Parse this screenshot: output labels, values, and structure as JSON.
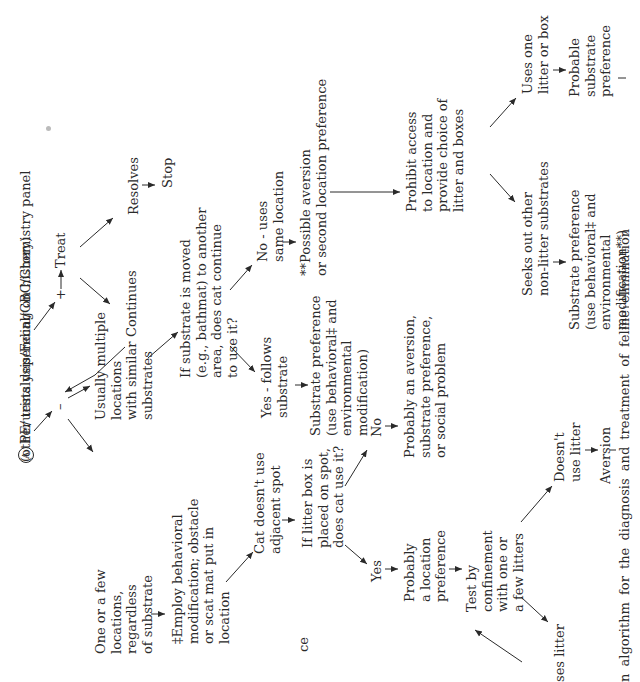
{
  "figure": {
    "start_marker": "A",
    "start_text": "PE/urinalysis/Fecal/CBC/Chemistry panel",
    "start_subtext": "(other tests depending on history)",
    "plus": "+",
    "minus": "–",
    "treat": "Treat",
    "resolves": "Resolves",
    "stop": "Stop",
    "continues": "Continues",
    "few_locations": "One or a few\nlocations,\nregardless\nof substrate",
    "multiple_locations": "Usually multiple\nlocations\nwith similar\nsubstrates",
    "employ_behavioral": "‡Employ behavioral\nmodification; obstacle\nor scat mat put in\nlocation",
    "cat_doesnt_use": "Cat doesn't use\nadjacent spot",
    "litter_box_question": "If litter box is\nplaced on spot,\ndoes cat use it?",
    "yes": "Yes",
    "no": "No",
    "probably_location": "Probably\na location\npreference",
    "probably_aversion": "Probably an aversion,\nsubstrate preference,\nor social problem",
    "test_confinement": "Test by\nconfinement\nwith one or\na few litters",
    "uses_litter_partial": "ses litter",
    "doesnt_use_litter": "Doesn't\nuse litter",
    "aversion": "Aversion",
    "substrate_moved_question": "If substrate is moved\n(e.g., bathmat) to another\narea, does cat continue\nto use it?",
    "yes_follows": "Yes - follows\nsubstrate",
    "no_uses_same": "No - uses\nsame location",
    "substrate_pref_1": "Substrate preference\n(use behavioral‡ and\nenvironmental\nmodification)",
    "possible_aversion": "**Possible aversion\nor second location preference",
    "prohibit_access": "Prohibit access\nto location and\nprovide choice of\nlitter and boxes",
    "seeks_other": "Seeks out other\nnon-litter substrates",
    "uses_one_litter": "Uses one\nlitter or box",
    "probable_substrate": "Probable\nsubstrate\npreference",
    "substrate_pref_2": "Substrate preference\n(use behavioral‡ and\nenvironmental\nmodification**)",
    "partial_left_ce": "ce",
    "caption_partial": "n algorithm for the diagnosis and treatment of feline elimination"
  }
}
